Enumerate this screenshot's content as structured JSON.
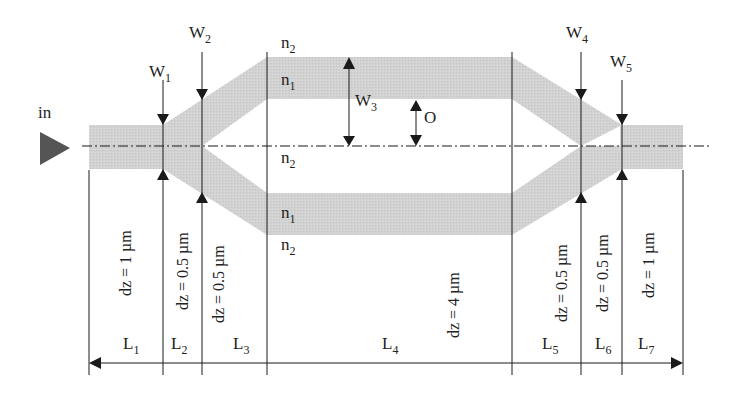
{
  "diagram": {
    "type": "Mach-Zehnder interferometer waveguide layout",
    "colors": {
      "waveguide": "#d0d0d0",
      "lines": "#1a1a1a",
      "input_arrow": "#555555",
      "background": "#ffffff"
    },
    "input_label": "in",
    "widths": [
      {
        "base": "W",
        "sub": "1"
      },
      {
        "base": "W",
        "sub": "2"
      },
      {
        "base": "W",
        "sub": "3"
      },
      {
        "base": "W",
        "sub": "4"
      },
      {
        "base": "W",
        "sub": "5"
      }
    ],
    "offset_label": "O",
    "indices": {
      "top_cladding": {
        "base": "n",
        "sub": "2"
      },
      "upper_core": {
        "base": "n",
        "sub": "1"
      },
      "center_cladding": {
        "base": "n",
        "sub": "2"
      },
      "lower_core": {
        "base": "n",
        "sub": "1"
      },
      "bottom_cladding": {
        "base": "n",
        "sub": "2"
      }
    },
    "step_sizes": [
      "dz = 1 µm",
      "dz = 0.5 µm",
      "dz = 0.5 µm",
      "dz = 4 µm",
      "dz = 0.5 µm",
      "dz = 0.5 µm",
      "dz = 1 µm"
    ],
    "sections": [
      {
        "base": "L",
        "sub": "1"
      },
      {
        "base": "L",
        "sub": "2"
      },
      {
        "base": "L",
        "sub": "3"
      },
      {
        "base": "L",
        "sub": "4"
      },
      {
        "base": "L",
        "sub": "5"
      },
      {
        "base": "L",
        "sub": "6"
      },
      {
        "base": "L",
        "sub": "7"
      }
    ]
  }
}
